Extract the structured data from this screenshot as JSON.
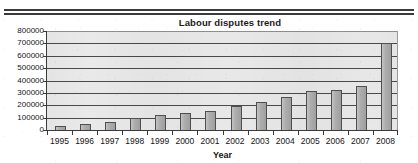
{
  "page": {
    "background_color": "#ffffff",
    "rule_color": "#3a3a3a"
  },
  "chart_data": {
    "type": "bar",
    "title": "Labour disputes trend",
    "subtitle": "",
    "xlabel": "Year",
    "ylabel": "",
    "categories": [
      "1995",
      "1996",
      "1997",
      "1998",
      "1999",
      "2000",
      "2001",
      "2002",
      "2003",
      "2004",
      "2005",
      "2006",
      "2007",
      "2008"
    ],
    "values": [
      30000,
      45000,
      65000,
      95000,
      120000,
      135000,
      155000,
      195000,
      228000,
      265000,
      318000,
      320000,
      355000,
      700000
    ],
    "series": [
      {
        "name": "Labour disputes",
        "values": [
          30000,
          45000,
          65000,
          95000,
          120000,
          135000,
          155000,
          195000,
          228000,
          265000,
          318000,
          320000,
          355000,
          700000
        ]
      }
    ],
    "ylim": [
      0,
      800000
    ],
    "xlim_categories": 14,
    "ytick_labels": [
      "0",
      "100000",
      "200000",
      "300000",
      "400000",
      "500000",
      "600000",
      "700000",
      "800000"
    ],
    "ytick_values": [
      0,
      100000,
      200000,
      300000,
      400000,
      500000,
      600000,
      700000,
      800000
    ],
    "ytick_step": 100000,
    "grid": true,
    "grid_axis": "y",
    "legend": false,
    "legend_position": "none",
    "bar_color": "#a9a9a9",
    "bar_edge_color": "#4f4f4f",
    "plot_background_color": "#e9e9e9",
    "gridline_color": "#4a4a4a",
    "axis_color": "#3a3a3a",
    "text_color": "#141414"
  }
}
